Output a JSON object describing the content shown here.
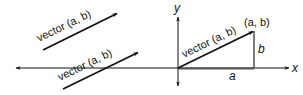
{
  "diagram": {
    "colors": {
      "stroke": "#111111",
      "background": "#ffffff"
    },
    "axes": {
      "x_label": "x",
      "y_label": "y",
      "origin": [
        178,
        68
      ]
    },
    "vectors": [
      {
        "id": "free-vector-top",
        "label": "vector (a, b)",
        "from": [
          43,
          50
        ],
        "to": [
          118,
          13
        ]
      },
      {
        "id": "free-vector-bottom",
        "label": "vector (a, b)",
        "from": [
          63,
          89
        ],
        "to": [
          139,
          52
        ]
      },
      {
        "id": "position-vector",
        "label": "vector (a, b)",
        "from": [
          178,
          68
        ],
        "to": [
          254,
          31
        ]
      }
    ],
    "point_label": "(a, b)",
    "component_labels": {
      "horizontal": "a",
      "vertical": "b"
    }
  }
}
